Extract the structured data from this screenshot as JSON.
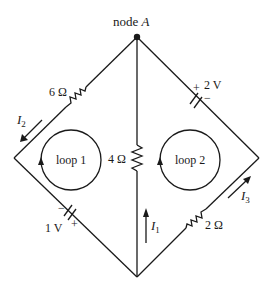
{
  "diagram": {
    "type": "circuit",
    "node": {
      "label_prefix": "node ",
      "label_var": "A"
    },
    "resistors": [
      {
        "id": "r6",
        "label": "6 Ω",
        "branch": "top-left"
      },
      {
        "id": "r4",
        "label": "4 Ω",
        "branch": "center"
      },
      {
        "id": "r2",
        "label": "2 Ω",
        "branch": "bottom-right"
      }
    ],
    "sources": [
      {
        "id": "v2",
        "label": "2 V",
        "plus": "+",
        "minus": "−",
        "branch": "top-right"
      },
      {
        "id": "v1",
        "label": "1 V",
        "plus": "+",
        "minus": "−",
        "branch": "bottom-left"
      }
    ],
    "currents": [
      {
        "id": "i1",
        "var": "I",
        "sub": "1",
        "branch": "center",
        "direction": "up"
      },
      {
        "id": "i2",
        "var": "I",
        "sub": "2",
        "branch": "top-left",
        "direction": "down-left"
      },
      {
        "id": "i3",
        "var": "I",
        "sub": "3",
        "branch": "bottom-right",
        "direction": "up-right"
      }
    ],
    "loops": [
      {
        "id": "loop1",
        "label": "loop 1",
        "direction": "clockwise"
      },
      {
        "id": "loop2",
        "label": "loop 2",
        "direction": "clockwise"
      }
    ]
  }
}
